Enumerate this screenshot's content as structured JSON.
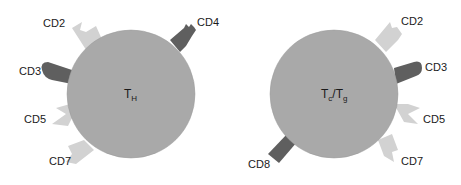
{
  "colors": {
    "background": "#ffffff",
    "cell_fill": "#a9a9a9",
    "cell_stroke": "#9a9a9a",
    "light_receptor": "#d2d2d2",
    "dark_receptor": "#5f5f5f",
    "text": "#1a1a1a"
  },
  "cells": [
    {
      "name": "helper-t-cell",
      "label_main": "T",
      "label_sub": "H",
      "receptors": [
        {
          "label": "CD2",
          "shade": "light"
        },
        {
          "label": "CD4",
          "shade": "dark"
        },
        {
          "label": "CD3",
          "shade": "dark"
        },
        {
          "label": "CD5",
          "shade": "light"
        },
        {
          "label": "CD7",
          "shade": "light"
        }
      ]
    },
    {
      "name": "cytotoxic-suppressor-t-cell",
      "label_main_1": "T",
      "label_sub_1": "c",
      "label_sep": "/",
      "label_main_2": "T",
      "label_sub_2": "g",
      "receptors": [
        {
          "label": "CD2",
          "shade": "light"
        },
        {
          "label": "CD3",
          "shade": "dark"
        },
        {
          "label": "CD5",
          "shade": "light"
        },
        {
          "label": "CD7",
          "shade": "light"
        },
        {
          "label": "CD8",
          "shade": "dark"
        }
      ]
    }
  ]
}
